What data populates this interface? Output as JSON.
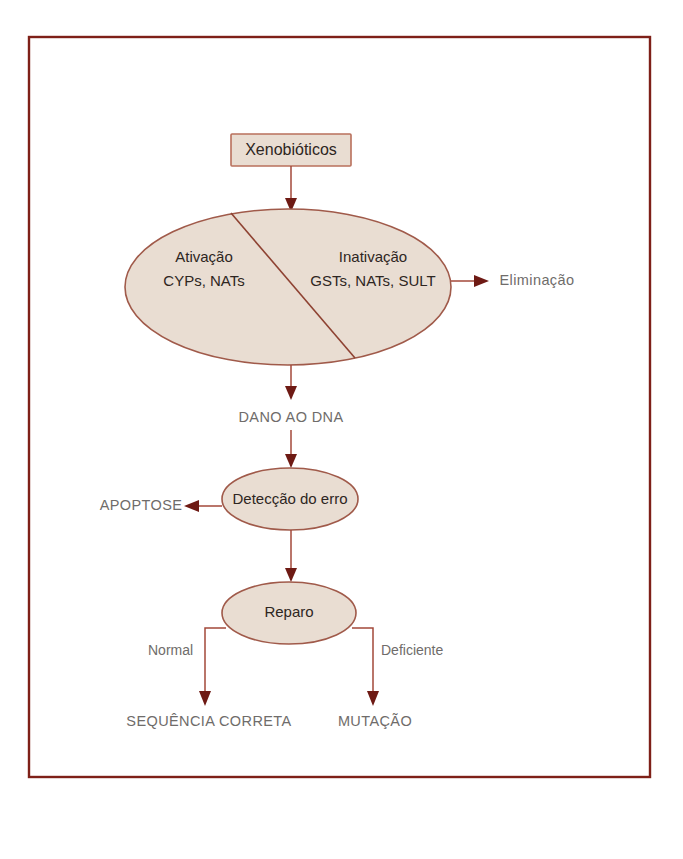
{
  "figure": {
    "frame_color": "#7e2018",
    "node_fill": "#e9ddd2",
    "node_stroke": "#a05a4a",
    "connector_color": "#a3483a",
    "arrow_color": "#6e1a14",
    "outer_label_color": "#6f6c6a",
    "shape_label_color": "#2e2622"
  },
  "nodes": {
    "xenobiotics_box": {
      "label": "Xenobióticos",
      "shape": "rectangle"
    },
    "metabolism_ellipse": {
      "shape": "ellipse-split",
      "left_line1": "Ativação",
      "left_line2": "CYPs, NATs",
      "right_line1": "Inativação",
      "right_line2": "GSTs, NATs, SULT"
    },
    "dna_damage": {
      "label": "DANO AO DNA",
      "shape": "text"
    },
    "error_detection_ellipse": {
      "label": "Detecção do erro",
      "shape": "ellipse"
    },
    "apoptosis": {
      "label": "APOPTOSE",
      "shape": "text"
    },
    "repair_ellipse": {
      "label": "Reparo",
      "shape": "ellipse"
    },
    "correct_sequence": {
      "label": "SEQUÊNCIA CORRETA",
      "shape": "text"
    },
    "mutation": {
      "label": "MUTAÇÃO",
      "shape": "text"
    },
    "elimination": {
      "label": "Eliminação",
      "shape": "text"
    }
  },
  "edge_labels": {
    "normal": "Normal",
    "deficient": "Deficiente"
  }
}
